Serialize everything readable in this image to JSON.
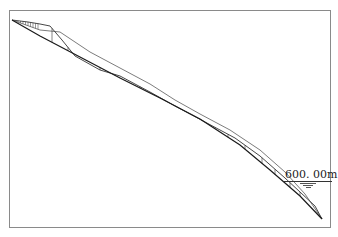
{
  "diagram": {
    "type": "longitudinal-profile",
    "frame": {
      "x": 9,
      "y": 10,
      "width": 321,
      "height": 217,
      "color": "#8a8a8a"
    },
    "water_level_label": "600. 00m",
    "water_level_icon": "water-level-triangle-icon",
    "colors": {
      "line": "#1a1a1a",
      "frame": "#8a8a8a",
      "background": "#ffffff"
    },
    "bottom_profile": [
      [
        12,
        20
      ],
      [
        40,
        36
      ],
      [
        80,
        57
      ],
      [
        120,
        78
      ],
      [
        160,
        98
      ],
      [
        200,
        119
      ],
      [
        240,
        145
      ],
      [
        270,
        170
      ],
      [
        300,
        196
      ],
      [
        322,
        219
      ]
    ],
    "top_profile": [
      [
        12,
        20
      ],
      [
        28,
        22
      ],
      [
        40,
        24
      ],
      [
        50,
        26
      ],
      [
        62,
        40
      ],
      [
        75,
        56
      ],
      [
        100,
        70
      ],
      [
        120,
        76
      ],
      [
        150,
        92
      ],
      [
        175,
        106
      ],
      [
        205,
        122
      ],
      [
        235,
        138
      ],
      [
        260,
        156
      ],
      [
        285,
        178
      ],
      [
        300,
        192
      ],
      [
        315,
        206
      ],
      [
        322,
        219
      ]
    ],
    "middle_profile": [
      [
        12,
        20
      ],
      [
        40,
        30
      ],
      [
        60,
        32
      ],
      [
        90,
        52
      ],
      [
        120,
        68
      ],
      [
        150,
        84
      ],
      [
        175,
        100
      ],
      [
        200,
        114
      ],
      [
        230,
        130
      ],
      [
        260,
        150
      ],
      [
        285,
        172
      ],
      [
        305,
        194
      ],
      [
        322,
        219
      ]
    ],
    "sections_x": [
      52,
      68,
      100,
      115,
      140,
      165,
      175,
      195,
      215,
      228,
      245,
      262,
      275,
      290,
      300
    ],
    "hatch_region": {
      "x_start": 18,
      "x_end": 38,
      "step": 2.5
    }
  }
}
